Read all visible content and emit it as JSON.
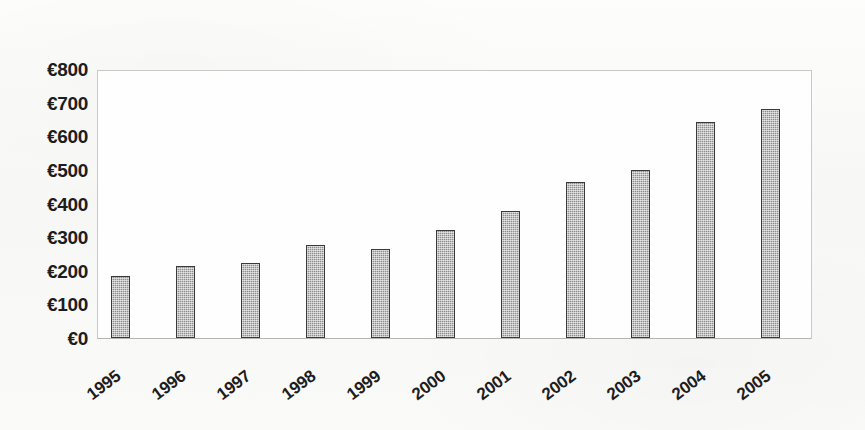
{
  "chart_data": {
    "type": "bar",
    "title": "",
    "subtitle": "",
    "xlabel": "",
    "ylabel": "",
    "categories": [
      "1995",
      "1996",
      "1997",
      "1998",
      "1999",
      "2000",
      "2001",
      "2002",
      "2003",
      "2004",
      "2005"
    ],
    "values": [
      185,
      215,
      222,
      277,
      265,
      320,
      378,
      465,
      500,
      643,
      680
    ],
    "value_prefix": "€",
    "ylim": [
      0,
      800
    ],
    "ytick_step": 100,
    "ytick_labels": [
      "€800",
      "€700",
      "€600",
      "€500",
      "€400",
      "€300",
      "€200",
      "€100",
      "€0"
    ],
    "ytick_values": [
      800,
      700,
      600,
      500,
      400,
      300,
      200,
      100,
      0
    ],
    "grid": false,
    "legend": false,
    "legend_position": "none",
    "series": [
      {
        "name": "",
        "values": [
          185,
          215,
          222,
          277,
          265,
          320,
          378,
          465,
          500,
          643,
          680
        ]
      }
    ],
    "xtick_rotation": -37,
    "annotations": []
  },
  "style": {
    "bar_fill": "#8e8e8e",
    "bar_border": "#3a3a3a",
    "plot_frame": "#c9c9c9",
    "axis_line": "#b4b4b4",
    "text": "#1d1d1d",
    "background": "#fbfbfa",
    "plot_background": "#fefefe"
  }
}
